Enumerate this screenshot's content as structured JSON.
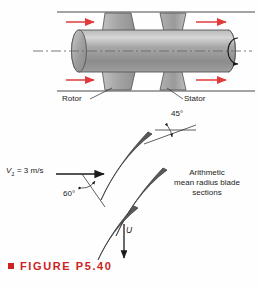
{
  "figure": {
    "caption": "FIGURE P5.40",
    "caption_color": "#cc2222",
    "bullet_icon": "red-square-bullet"
  },
  "machine_diagram": {
    "labels": {
      "rotor": "Rotor",
      "stator": "Stator"
    },
    "flow_arrow_color": "#e03a3a",
    "flow_arrow_count": 4,
    "rotation_icon": "curved-rotation-arrow",
    "centerline_style": "dash-dot",
    "blade_count": 4,
    "body_fill": "#9a9a9a"
  },
  "cascade_diagram": {
    "inlet_velocity_label": "V",
    "inlet_velocity_subscript": "1",
    "inlet_velocity_value": "= 3 m/s",
    "angle_45": "45°",
    "angle_60": "60°",
    "blade_speed_label": "U",
    "note_line_1": "Arithmetic",
    "note_line_2": "mean radius blade",
    "note_line_3": "sections",
    "blade_count": 3,
    "blade_fill": "#5a5a5a"
  }
}
